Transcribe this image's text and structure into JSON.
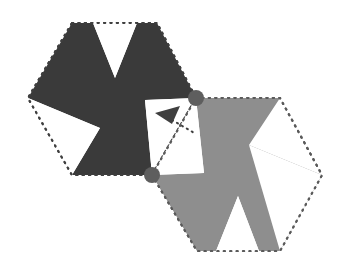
{
  "figure": {
    "title": "Two pinwheel hexagon tiles joined at two pivot points",
    "background_color": "#ffffff",
    "width": 358,
    "height": 276,
    "shapes": [
      {
        "name": "dark-pinwheel",
        "label": "dark pinwheel tile",
        "fill_color": "#3a3a3a",
        "outline_style": "dotted",
        "outline_color": "#3f3f3f",
        "hexagon_points": "72,23 157,23 196,98 152,175 72,175 28,98",
        "pinwheel_points": "72,23 93,23 115,78 137,23 157,23 196,98 145,100 152,175 72,175 100,128 28,98",
        "notches": [
          {
            "name": "top-notch",
            "points": "93,23 137,23 115,78"
          },
          {
            "name": "lower-left-notch",
            "points": "28,98 100,128 72,175"
          },
          {
            "name": "right-notch",
            "points": "196,98 145,100 152,175"
          }
        ]
      },
      {
        "name": "grey-pinwheel",
        "label": "grey pinwheel tile",
        "fill_color": "#8e8e8e",
        "outline_style": "dotted",
        "outline_color": "#5a5a5a",
        "hexagon_points": "196,98 280,98 322,175 280,251 197,251 152,175",
        "pinwheel_points": "280,251 259,251 238,196 216,251 197,251 152,175 204,173 196,98 280,98 249,145 322,175",
        "notches": [
          {
            "name": "bottom-notch",
            "points": "216,251 259,251 238,196"
          },
          {
            "name": "upper-right-notch",
            "points": "322,175 249,145 280,251"
          },
          {
            "name": "left-notch",
            "points": "152,175 204,173 196,98"
          }
        ]
      }
    ],
    "pivots": [
      {
        "name": "pivot-upper",
        "cx": 196,
        "cy": 98,
        "r": 8,
        "color": "#5e5e5e"
      },
      {
        "name": "pivot-lower",
        "cx": 152,
        "cy": 175,
        "r": 8,
        "color": "#5e5e5e"
      }
    ],
    "arrow": {
      "name": "rotation-arrow",
      "color": "#3f3f3f",
      "head_points": "155,113 180,106 172,124",
      "tail_path": "M 172 120 L 196 134",
      "tail_style": "dotted"
    }
  }
}
